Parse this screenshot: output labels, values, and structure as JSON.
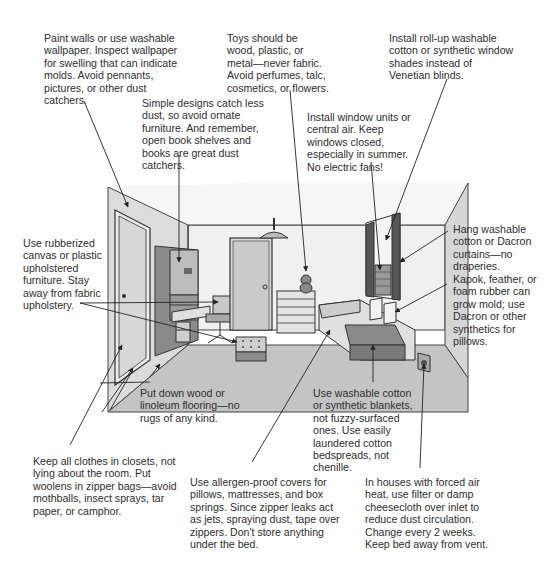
{
  "diagram": {
    "notes": {
      "walls": "Paint walls or use washable\nwallpaper. Inspect wallpaper\nfor swelling that can indicate\nmolds. Avoid pennants,\npictures, or other dust\ncatchers.",
      "toys": "Toys should be\nwood, plastic, or\nmetal—never fabric.\nAvoid perfumes, talc,\ncosmetics, or flowers.",
      "shades": "Install roll-up washable\ncotton or synthetic window\nshades instead of\nVenetian blinds.",
      "furniture_design": "Simple designs catch less\ndust, so avoid ornate\nfurniture. And remember,\nopen book shelves and\nbooks are great dust\ncatchers.",
      "air": "Install window units or\ncentral air. Keep\nwindows closed,\nespecially in summer.\nNo electric fans!",
      "curtains": "Hang washable\ncotton or Dacron\ncurtains—no\ndraperies.",
      "upholstery": "Use rubberized\ncanvas or plastic\nupholstered\nfurniture. Stay\naway from fabric\nupholstery.",
      "pillows": "Kapok, feather, or\nfoam rubber can\ngrow mold; use\nDacron or other\nsynthetics for\npillows.",
      "flooring": "Put down wood or\nlinoleum flooring—no\nrugs of any kind.",
      "blankets": "Use washable cotton\nor synthetic blankets,\nnot fuzzy-surfaced\nones. Use easily\nlaundered cotton\nbedspreads, not\nchenille.",
      "clothes": "Keep all clothes in closets, not\nlying about the room. Put\nwoolens in zipper bags—avoid\nmothballs, insect sprays, tar\npaper, or camphor.",
      "covers": "Use allergen-proof covers for\npillows, mattresses, and box\nsprings. Since zipper leaks act\nas jets, spraying dust, tape over\nzippers. Don't store anything\nunder the bed.",
      "vent": "In houses with forced air\nheat, use filter or damp\ncheesecloth over inlet to\nreduce dust circulation.\nChange every 2 weeks.\nKeep bed away from vent."
    },
    "colors": {
      "wall_light": "#e6e6e6",
      "wall_mid": "#cfcfcf",
      "floor": "#bdbdbd",
      "dark": "#6a6a6a",
      "line": "#333333"
    }
  }
}
